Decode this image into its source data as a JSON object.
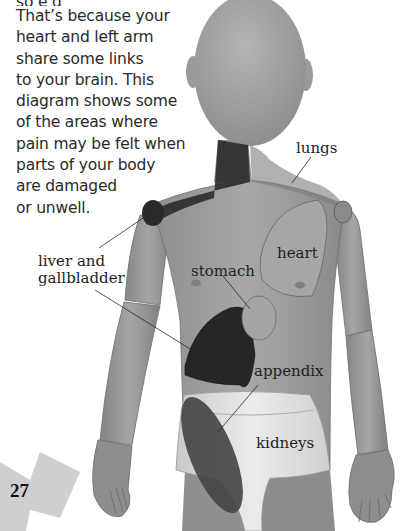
{
  "intro_text": {
    "lines": [
      "so  e g   ",
      "That’s because your",
      "heart and left arm",
      "share some links",
      "to your brain. This",
      "diagram shows some",
      "of the areas where",
      "pain may be felt when",
      "parts of your body",
      "are damaged",
      "or unwell."
    ]
  },
  "labels": {
    "lungs": "lungs",
    "liver": "liver and",
    "liver_line2": "gallbladder",
    "heart": "heart",
    "stomach": "stomach",
    "appendix": "appendix",
    "kidneys": "kidneys"
  },
  "page_number": "27",
  "colors": {
    "body": "#9a9a9a",
    "shoulder_dark": "#3a3a3a",
    "liver": "#2a2a2a",
    "kidney": "#4a4a4a",
    "lungs_shade": "#808080",
    "badge": "#cfcfcf",
    "shorts": "#e0e0e0"
  }
}
